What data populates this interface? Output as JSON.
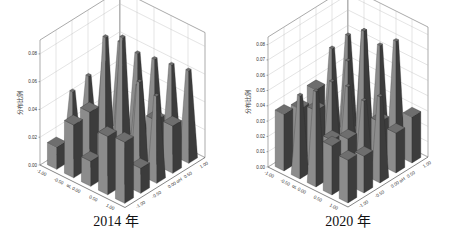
{
  "chart_data": [
    {
      "type": "bar3d",
      "title": "2014 年",
      "zlabel": "分布比例",
      "x_axis_title": "αL",
      "y_axis_title": "αH",
      "x_ticks": [
        "-1.00",
        "-0.50",
        "0.00",
        "0.50",
        "1.00"
      ],
      "y_ticks": [
        "-1.00",
        "-0.50",
        "0.00",
        "0.50",
        "1.00"
      ],
      "z_ticks": [
        "0.00",
        "0.02",
        "0.04",
        "0.06",
        "0.08"
      ],
      "zlim": [
        0,
        0.09
      ],
      "grid": true,
      "values": [
        [
          0.016,
          0.046,
          0.05,
          0.052,
          0.06
        ],
        [
          0.038,
          0.04,
          0.084,
          0.056,
          0.058
        ],
        [
          0.018,
          0.028,
          0.09,
          0.048,
          0.06
        ],
        [
          0.042,
          0.026,
          0.064,
          0.032,
          0.062
        ],
        [
          0.044,
          0.018,
          0.06,
          0.034,
          0.064
        ]
      ]
    },
    {
      "type": "bar3d",
      "title": "2020 年",
      "zlabel": "分布比例",
      "x_axis_title": "αL",
      "y_axis_title": "αH",
      "x_ticks": [
        "-1.00",
        "-0.50",
        "0.00",
        "0.50",
        "1.00"
      ],
      "y_ticks": [
        "-1.00",
        "-0.50",
        "0.00",
        "0.50",
        "1.00"
      ],
      "z_ticks": [
        "0.00",
        "0.01",
        "0.02",
        "0.03",
        "0.04",
        "0.05",
        "0.06",
        "0.07",
        "0.08"
      ],
      "zlim": [
        0,
        0.085
      ],
      "grid": true,
      "values": [
        [
          0.037,
          0.034,
          0.04,
          0.058,
          0.06
        ],
        [
          0.052,
          0.038,
          0.048,
          0.055,
          0.068
        ],
        [
          0.06,
          0.024,
          0.05,
          0.08,
          0.064
        ],
        [
          0.032,
          0.03,
          0.046,
          0.028,
          0.072
        ],
        [
          0.028,
          0.024,
          0.054,
          0.026,
          0.03
        ]
      ]
    }
  ]
}
